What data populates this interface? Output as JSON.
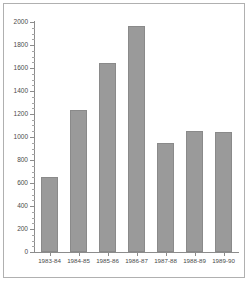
{
  "chart_data": {
    "type": "bar",
    "title": "",
    "subtitle": "",
    "xlabel": "",
    "ylabel": "",
    "categories": [
      "1983-84",
      "1984-85",
      "1985-86",
      "1986-87",
      "1987-88",
      "1988-89",
      "1989-90"
    ],
    "values": [
      650,
      1235,
      1640,
      1965,
      945,
      1050,
      1045
    ],
    "ylim": [
      0,
      2000
    ],
    "ytick_labels": [
      "0",
      "200",
      "400",
      "600",
      "800",
      "1000",
      "1200",
      "1400",
      "1600",
      "1800",
      "2000"
    ],
    "ytick_values": [
      0,
      200,
      400,
      600,
      800,
      1000,
      1200,
      1400,
      1600,
      1800,
      2000
    ],
    "ytick_interval": 200,
    "minor_tick_interval": 50,
    "grid": false,
    "legend": null,
    "legend_position": "none",
    "series": [
      {
        "name": "series-1",
        "values": [
          650,
          1235,
          1640,
          1965,
          945,
          1050,
          1045
        ]
      }
    ],
    "colors": {
      "bar_fill": "#9a9a9a",
      "bar_stroke": "#8a8a8a",
      "axis": "#8c8c8c",
      "text": "#4a4a4a",
      "frame": "#b0b0b0",
      "background": "#ffffff"
    }
  }
}
